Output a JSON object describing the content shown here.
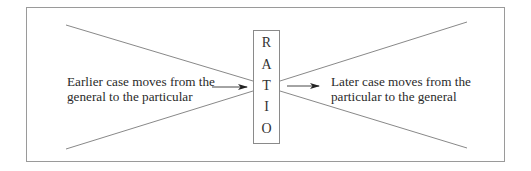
{
  "diagram": {
    "center_label": {
      "letters": [
        "R",
        "A",
        "T",
        "I",
        "O"
      ],
      "word": "RATIO"
    },
    "left_caption": {
      "line1": "Earlier case moves from the",
      "line2": "general to the particular"
    },
    "right_caption": {
      "line1": "Later case moves from the",
      "line2": "particular to the general"
    },
    "colors": {
      "line": "#7a7a7a",
      "frame": "#9a9a9a",
      "arrow": "#222222",
      "text": "#2a2a2a"
    }
  }
}
